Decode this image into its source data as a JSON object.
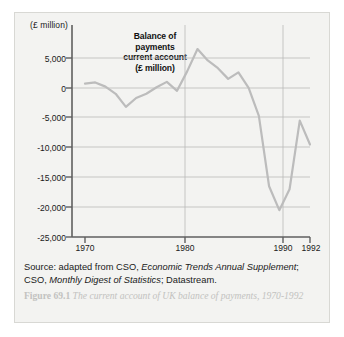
{
  "panel": {
    "background_color": "#f3f3f1",
    "border_color": "#d8d8d4"
  },
  "chart_data": {
    "type": "line",
    "title": "Balance of payments current account (£ million)",
    "title_lines": [
      "Balance of",
      "payments",
      "current account",
      "(£ million)"
    ],
    "xlabel": "",
    "ylabel": "(£ million)",
    "ylim": [
      -25000,
      7500
    ],
    "xlim": [
      1970,
      1992
    ],
    "grid": true,
    "legend": "none",
    "line_color": "#bcbcbc",
    "axis_color": "#6e6e6e",
    "grid_color": "#b9b9b9",
    "yticks": [
      5000,
      0,
      -5000,
      -10000,
      -15000,
      -20000,
      -25000
    ],
    "ytick_labels": [
      "5,000",
      "0",
      "-5,000",
      "-10,000",
      "-15,000",
      "-20,000",
      "-25,000"
    ],
    "xticks": [
      1970,
      1980,
      1990,
      1992
    ],
    "xtick_labels": [
      "1970",
      "1980",
      "1990",
      "1992"
    ],
    "x": [
      1970,
      1971,
      1972,
      1973,
      1974,
      1975,
      1976,
      1977,
      1978,
      1979,
      1980,
      1981,
      1982,
      1983,
      1984,
      1985,
      1986,
      1987,
      1988,
      1989,
      1990,
      1991,
      1992
    ],
    "values": [
      700,
      900,
      200,
      -1000,
      -3200,
      -1700,
      -1000,
      100,
      1000,
      -500,
      2800,
      6500,
      4600,
      3300,
      1500,
      2600,
      0,
      -4700,
      -16500,
      -20500,
      -17000,
      -5500,
      -9500
    ],
    "series": [
      {
        "name": "Balance of payments current account (£ million)",
        "values": [
          700,
          900,
          200,
          -1000,
          -3200,
          -1700,
          -1000,
          100,
          1000,
          -500,
          2800,
          6500,
          4600,
          3300,
          1500,
          2600,
          0,
          -4700,
          -16500,
          -20500,
          -17000,
          -5500,
          -9500
        ]
      }
    ]
  },
  "source": {
    "prefix": "Source: adapted from CSO, ",
    "italic1": "Economic Trends Annual Supplement",
    "mid": "; CSO, ",
    "italic2": "Monthly Digest of Statistics",
    "suffix": "; Datastream."
  },
  "caption": {
    "figure_number": "Figure 69.1",
    "text": " The current account of UK balance of payments, 1970-1992"
  }
}
